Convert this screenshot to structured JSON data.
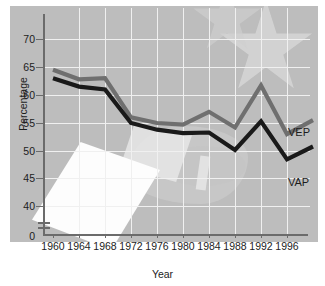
{
  "chart": {
    "ylabel": "Percentage",
    "xlabel": "Year",
    "yticks": [
      "70",
      "65",
      "60",
      "55",
      "50",
      "45",
      "40",
      "0"
    ],
    "xticks": [
      "1960",
      "1964",
      "1968",
      "1972",
      "1976",
      "1980",
      "1984",
      "1988",
      "1992",
      "1996"
    ],
    "series_labels": {
      "vep": "VEP",
      "vap": "VAP"
    },
    "colors": {
      "vep": "#6f6f6f",
      "vap": "#1a1a1a",
      "panel": "#bdbdbd",
      "grid": "#f0f0f0",
      "axis": "#6b6b6b"
    }
  },
  "chart_data": {
    "type": "line",
    "title": "",
    "xlabel": "Year",
    "ylabel": "Percentage",
    "x": [
      1960,
      1964,
      1968,
      1972,
      1976,
      1980,
      1984,
      1988,
      1992,
      1996,
      2000
    ],
    "xlim": [
      1960,
      2000
    ],
    "ylim": [
      38,
      72
    ],
    "yticks": [
      40,
      45,
      50,
      55,
      60,
      65,
      70
    ],
    "xticks": [
      1960,
      1964,
      1968,
      1972,
      1976,
      1980,
      1984,
      1988,
      1992,
      1996
    ],
    "axis_break": true,
    "grid": true,
    "legend": "inline-right",
    "series": [
      {
        "name": "VEP",
        "color": "#6f6f6f",
        "values": [
          64.5,
          62.8,
          63.0,
          56.0,
          55.0,
          54.7,
          57.0,
          54.2,
          61.7,
          53.0,
          55.5
        ]
      },
      {
        "name": "VAP",
        "color": "#1a1a1a",
        "values": [
          63.0,
          61.5,
          61.0,
          55.0,
          53.8,
          53.2,
          53.3,
          50.2,
          55.3,
          48.5,
          50.8
        ]
      }
    ],
    "annotations": [
      {
        "text": "VEP",
        "x": 1997.5,
        "y": 57.0
      },
      {
        "text": "VAP",
        "x": 1997.5,
        "y": 47.8
      }
    ]
  }
}
